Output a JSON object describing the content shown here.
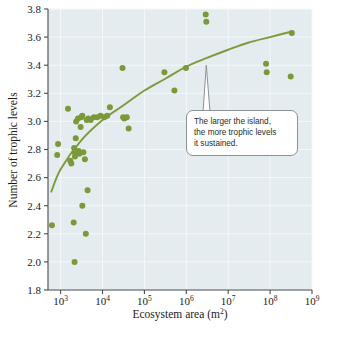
{
  "figure": {
    "background": "#ffffff",
    "plot_background": "#e4ecef",
    "marker_color": "#7a9a3a",
    "curve_color": "#7d9b3c",
    "axis_color": "#4a4a4a",
    "grid_color": "#f4f8f9",
    "callout_border": "#8c9196",
    "callout_background": "#ffffff"
  },
  "callout": {
    "name": "island-size-annotation",
    "lines": [
      "The larger the island,",
      "the more trophic levels",
      "it sustained."
    ],
    "text": "The larger the island, the more trophic levels it sustained."
  },
  "caption": {
    "text": ""
  },
  "chart_data": {
    "type": "scatter",
    "title": "",
    "subtitle": "",
    "xlabel": "Ecosystem area (m²)",
    "xlabel_base": "Ecosystem area (m",
    "xlabel_sup": "2",
    "xlabel_tail": ")",
    "ylabel": "Number of trophic levels",
    "xscale": "log",
    "yscale": "linear",
    "xlim": [
      500,
      1000000000
    ],
    "ylim": [
      1.8,
      3.8
    ],
    "grid": true,
    "legend": "none",
    "xticks": [
      1000,
      10000,
      100000,
      1000000,
      10000000,
      100000000,
      1000000000
    ],
    "xtick_labels": [
      "10³",
      "10⁴",
      "10⁵",
      "10⁶",
      "10⁷",
      "10⁸",
      "10⁹"
    ],
    "xtick_exponents": [
      "3",
      "4",
      "5",
      "6",
      "7",
      "8",
      "9"
    ],
    "xtick_mantissa": "10",
    "yticks": [
      1.8,
      2.0,
      2.2,
      2.4,
      2.6,
      2.8,
      3.0,
      3.2,
      3.4,
      3.6,
      3.8
    ],
    "ytick_labels": [
      "1.8",
      "2.0",
      "2.2",
      "2.4",
      "2.6",
      "2.8",
      "3.0",
      "3.2",
      "3.4",
      "3.6",
      "3.8"
    ],
    "series": [
      {
        "name": "Islands",
        "marker": "circle",
        "color": "#7a9a3a",
        "points": [
          {
            "x": 620,
            "y": 2.26
          },
          {
            "x": 870,
            "y": 2.84
          },
          {
            "x": 830,
            "y": 2.76
          },
          {
            "x": 1500,
            "y": 3.09
          },
          {
            "x": 1700,
            "y": 2.72
          },
          {
            "x": 1800,
            "y": 2.7
          },
          {
            "x": 2100,
            "y": 2.81
          },
          {
            "x": 2150,
            "y": 2.78
          },
          {
            "x": 2200,
            "y": 2.75
          },
          {
            "x": 2300,
            "y": 2.88
          },
          {
            "x": 2350,
            "y": 3.0
          },
          {
            "x": 2600,
            "y": 3.02
          },
          {
            "x": 2700,
            "y": 2.79
          },
          {
            "x": 2800,
            "y": 2.77
          },
          {
            "x": 3000,
            "y": 2.96
          },
          {
            "x": 3100,
            "y": 3.03
          },
          {
            "x": 3300,
            "y": 3.04
          },
          {
            "x": 3500,
            "y": 2.78
          },
          {
            "x": 3800,
            "y": 2.73
          },
          {
            "x": 4200,
            "y": 3.01
          },
          {
            "x": 4600,
            "y": 3.02
          },
          {
            "x": 5200,
            "y": 3.01
          },
          {
            "x": 6200,
            "y": 3.03
          },
          {
            "x": 7500,
            "y": 3.03
          },
          {
            "x": 9000,
            "y": 3.04
          },
          {
            "x": 11000,
            "y": 3.03
          },
          {
            "x": 13000,
            "y": 3.04
          },
          {
            "x": 15000,
            "y": 3.1
          },
          {
            "x": 2050,
            "y": 2.28
          },
          {
            "x": 2150,
            "y": 2.0
          },
          {
            "x": 3300,
            "y": 2.4
          },
          {
            "x": 4000,
            "y": 2.2
          },
          {
            "x": 4400,
            "y": 2.51
          },
          {
            "x": 30000,
            "y": 3.38
          },
          {
            "x": 31000,
            "y": 3.03
          },
          {
            "x": 33000,
            "y": 3.02
          },
          {
            "x": 38000,
            "y": 3.03
          },
          {
            "x": 42000,
            "y": 2.95
          },
          {
            "x": 300000,
            "y": 3.35
          },
          {
            "x": 520000,
            "y": 3.22
          },
          {
            "x": 980000,
            "y": 3.38
          },
          {
            "x": 2900000,
            "y": 3.76
          },
          {
            "x": 3000000,
            "y": 3.71
          },
          {
            "x": 80000000,
            "y": 3.41
          },
          {
            "x": 83000000,
            "y": 3.35
          },
          {
            "x": 310000000,
            "y": 3.32
          },
          {
            "x": 330000000,
            "y": 3.63
          }
        ]
      }
    ],
    "trend_curve": {
      "name": "logarithmic fit",
      "color": "#7d9b3c",
      "points": [
        {
          "x": 600,
          "y": 2.5
        },
        {
          "x": 1000,
          "y": 2.66
        },
        {
          "x": 3000,
          "y": 2.86
        },
        {
          "x": 10000,
          "y": 3.01
        },
        {
          "x": 30000,
          "y": 3.11
        },
        {
          "x": 100000,
          "y": 3.22
        },
        {
          "x": 300000,
          "y": 3.3
        },
        {
          "x": 1000000,
          "y": 3.39
        },
        {
          "x": 3000000,
          "y": 3.45
        },
        {
          "x": 10000000,
          "y": 3.51
        },
        {
          "x": 30000000,
          "y": 3.56
        },
        {
          "x": 100000000,
          "y": 3.6
        },
        {
          "x": 330000000,
          "y": 3.64
        }
      ]
    }
  }
}
